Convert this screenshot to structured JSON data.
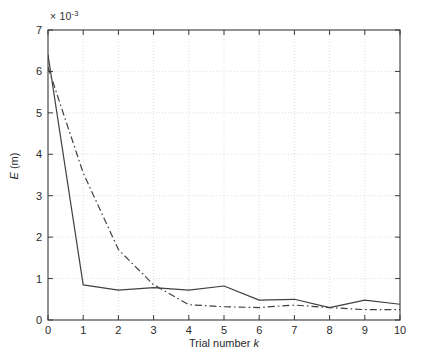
{
  "figure": {
    "background": "#ffffff",
    "axis_color": "#3a3a3a",
    "grid_color": "#cfcfcf",
    "series_color": "#404040"
  },
  "chart_data": {
    "type": "line",
    "title": "",
    "subtitle": "",
    "xlabel": "Trial number k",
    "ylabel": "E (m)",
    "y_multiplier": "× 10",
    "y_multiplier_exponent": "-3",
    "y_multiplier_text": "× 10⁻³",
    "x": [
      0,
      1,
      2,
      3,
      4,
      5,
      6,
      7,
      8,
      9,
      10
    ],
    "xlim": [
      0,
      10
    ],
    "ylim": [
      0,
      7
    ],
    "xticks": [
      0,
      1,
      2,
      3,
      4,
      5,
      6,
      7,
      8,
      9,
      10
    ],
    "yticks": [
      0,
      1,
      2,
      3,
      4,
      5,
      6,
      7
    ],
    "xtick_labels": [
      "0",
      "1",
      "2",
      "3",
      "4",
      "5",
      "6",
      "7",
      "8",
      "9",
      "10"
    ],
    "ytick_labels": [
      "0",
      "1",
      "2",
      "3",
      "4",
      "5",
      "6",
      "7"
    ],
    "grid": true,
    "grid_style": "dotted",
    "legend": null,
    "legend_position": "none",
    "series": [
      {
        "name": "solid",
        "linestyle": "solid",
        "color": "#404040",
        "values": [
          6.4,
          0.85,
          0.72,
          0.78,
          0.72,
          0.82,
          0.48,
          0.5,
          0.3,
          0.48,
          0.38
        ]
      },
      {
        "name": "dash-dot",
        "linestyle": "dashdot",
        "color": "#404040",
        "values": [
          6.1,
          3.55,
          1.7,
          0.85,
          0.37,
          0.32,
          0.3,
          0.36,
          0.3,
          0.25,
          0.25
        ]
      }
    ]
  }
}
